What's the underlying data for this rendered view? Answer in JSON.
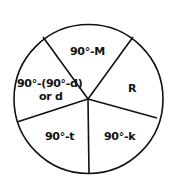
{
  "diagram": {
    "type": "pie-sector-diagram",
    "stroke_color": "#111111",
    "background_color": "#ffffff",
    "sectors": [
      {
        "id": "top",
        "label": "90°-M"
      },
      {
        "id": "right",
        "label": "R"
      },
      {
        "id": "bottom-right",
        "label": "90°-k"
      },
      {
        "id": "bottom-left",
        "label": "90°-t"
      },
      {
        "id": "left",
        "label_line1": "90°-(90°-d)",
        "label_line2": "or d"
      }
    ]
  }
}
